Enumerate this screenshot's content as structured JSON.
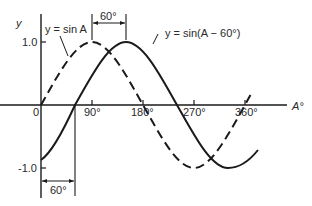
{
  "diagram": {
    "y_axis_label": "y",
    "x_axis_label": "A°",
    "y_ticks": [
      "1.0",
      "-1.0"
    ],
    "x_ticks": [
      "0",
      "90°",
      "180°",
      "270°",
      "360°"
    ],
    "curve_labels": {
      "dashed": "y = sin A",
      "solid": "y = sin(A − 60°)"
    },
    "phase_shift_labels": {
      "top": "60°",
      "bottom": "60°"
    },
    "colors": {
      "line": "#1a1a1a",
      "background": "#ffffff"
    }
  }
}
